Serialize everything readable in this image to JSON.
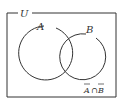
{
  "diagram": {
    "type": "venn",
    "universe_label": "U",
    "sets": [
      {
        "label": "A"
      },
      {
        "label": "B"
      }
    ],
    "shaded_region_label_parts": {
      "a": "A",
      "op": "∩",
      "b": "B"
    },
    "shaded_region_description": "complement of A intersect complement of B",
    "colors": {
      "stroke": "#333333",
      "background": "#ffffff"
    }
  }
}
